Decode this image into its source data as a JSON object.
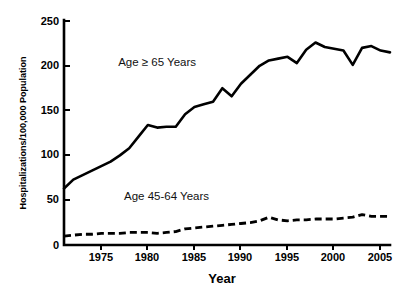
{
  "chart_data": {
    "type": "line",
    "title": "",
    "xlabel": "Year",
    "ylabel": "Hospitalizations/100,000 Population",
    "xlim": [
      1971,
      2006
    ],
    "ylim": [
      0,
      250
    ],
    "grid": false,
    "legend_position": "inline-annotation",
    "y_ticks": [
      "0",
      "50",
      "100",
      "150",
      "200",
      "250"
    ],
    "y_tick_values": [
      0,
      50,
      100,
      150,
      200,
      250
    ],
    "x_ticks": [
      "1975",
      "1980",
      "1985",
      "1990",
      "1995",
      "2000",
      "2005"
    ],
    "x_tick_values": [
      1975,
      1980,
      1985,
      1990,
      1995,
      2000,
      2005
    ],
    "x": [
      1971,
      1972,
      1973,
      1974,
      1975,
      1976,
      1977,
      1978,
      1979,
      1980,
      1981,
      1982,
      1983,
      1984,
      1985,
      1986,
      1987,
      1988,
      1989,
      1990,
      1991,
      1992,
      1993,
      1994,
      1995,
      1996,
      1997,
      1998,
      1999,
      2000,
      2001,
      2002,
      2003,
      2004,
      2005,
      2006
    ],
    "series": [
      {
        "name": "Age ≥ 65 Years",
        "style": "solid",
        "color": "#000000",
        "label_x": 1981,
        "label_y": 200,
        "values": [
          63,
          73,
          78,
          83,
          88,
          93,
          100,
          108,
          121,
          134,
          131,
          132,
          132,
          146,
          154,
          157,
          160,
          175,
          166,
          180,
          190,
          200,
          206,
          208,
          210,
          203,
          218,
          226,
          221,
          219,
          217,
          201,
          220,
          222,
          217,
          215
        ]
      },
      {
        "name": "Age 45-64 Years",
        "style": "dashed",
        "color": "#000000",
        "label_x": 1982,
        "label_y": 50,
        "values": [
          10,
          11,
          12,
          12,
          13,
          13,
          13,
          14,
          14,
          14,
          13,
          14,
          15,
          18,
          19,
          20,
          21,
          22,
          23,
          24,
          25,
          27,
          31,
          28,
          27,
          28,
          28,
          29,
          29,
          29,
          30,
          31,
          34,
          32,
          32,
          32
        ]
      }
    ]
  }
}
